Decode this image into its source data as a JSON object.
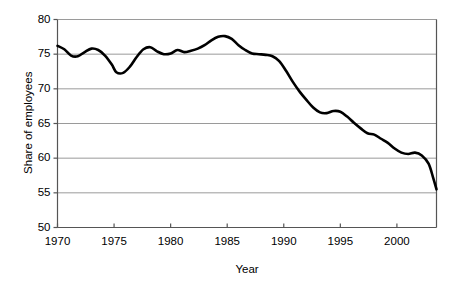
{
  "chart_data": {
    "type": "line",
    "title": "",
    "xlabel": "Year",
    "ylabel": "Share of employees",
    "xlim": [
      1970,
      2003.5
    ],
    "ylim": [
      50,
      80
    ],
    "xticks": [
      1970,
      1975,
      1980,
      1985,
      1990,
      1995,
      2000
    ],
    "xtick_labels": [
      "1970",
      "1975",
      "1980",
      "1985",
      "1990",
      "1995",
      "2000"
    ],
    "yticks": [
      50,
      55,
      60,
      65,
      70,
      75,
      80
    ],
    "ytick_labels": [
      "50",
      "55",
      "60",
      "65",
      "70",
      "75",
      "80"
    ],
    "grid": "horizontal",
    "legend": "none",
    "line_color": "#000000",
    "grid_color": "#9a9a9a",
    "axis_color": "#555555",
    "background_color": "#ffffff",
    "series": [
      {
        "name": "Share of employees",
        "x": [
          1970.0,
          1970.6,
          1971.2,
          1971.8,
          1972.4,
          1973.0,
          1973.6,
          1974.2,
          1974.8,
          1975.2,
          1975.8,
          1976.4,
          1977.0,
          1977.6,
          1978.2,
          1978.8,
          1979.4,
          1980.0,
          1980.6,
          1981.2,
          1981.8,
          1982.4,
          1983.0,
          1983.6,
          1984.2,
          1984.8,
          1985.4,
          1986.0,
          1986.6,
          1987.2,
          1987.8,
          1988.4,
          1989.0,
          1989.6,
          1990.2,
          1990.8,
          1991.4,
          1992.0,
          1992.6,
          1993.2,
          1993.8,
          1994.4,
          1995.0,
          1995.6,
          1996.2,
          1996.8,
          1997.4,
          1998.0,
          1998.6,
          1999.2,
          1999.8,
          2000.4,
          2001.0,
          2001.6,
          2002.2,
          2002.8,
          2003.2,
          2003.5
        ],
        "y": [
          76.2,
          75.7,
          74.8,
          74.7,
          75.3,
          75.8,
          75.6,
          74.8,
          73.5,
          72.4,
          72.3,
          73.2,
          74.6,
          75.7,
          76.0,
          75.4,
          75.0,
          75.1,
          75.6,
          75.3,
          75.5,
          75.8,
          76.3,
          77.0,
          77.5,
          77.6,
          77.2,
          76.3,
          75.6,
          75.1,
          75.0,
          74.9,
          74.7,
          74.0,
          72.6,
          71.0,
          69.6,
          68.4,
          67.3,
          66.6,
          66.5,
          66.8,
          66.7,
          66.0,
          65.1,
          64.3,
          63.6,
          63.4,
          62.8,
          62.2,
          61.4,
          60.8,
          60.6,
          60.8,
          60.4,
          59.2,
          57.2,
          55.5
        ]
      }
    ]
  },
  "axes": {
    "y_title": "Share of employees",
    "x_title": "Year"
  }
}
